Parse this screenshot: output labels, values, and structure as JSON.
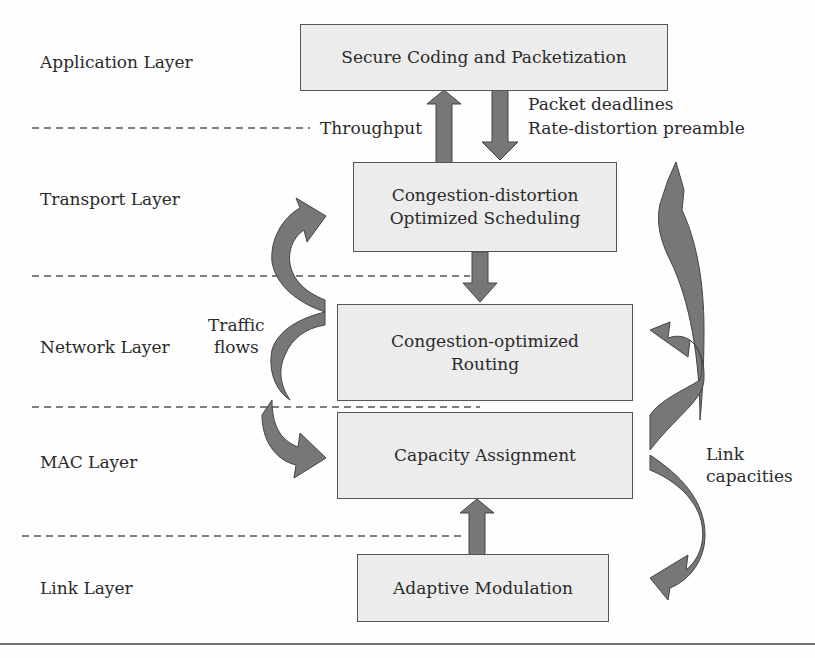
{
  "layers": [
    {
      "label": "Application Layer"
    },
    {
      "label": "Transport Layer"
    },
    {
      "label": "Network Layer"
    },
    {
      "label": "MAC Layer"
    },
    {
      "label": "Link Layer"
    }
  ],
  "boxes": {
    "application": {
      "line1": "Secure Coding and Packetization"
    },
    "transport": {
      "line1": "Congestion-distortion",
      "line2": "Optimized Scheduling"
    },
    "network": {
      "line1": "Congestion-optimized",
      "line2": "Routing"
    },
    "mac": {
      "line1": "Capacity Assignment"
    },
    "link": {
      "line1": "Adaptive Modulation"
    }
  },
  "annotations": {
    "throughput": "Throughput",
    "packet_deadlines": "Packet deadlines",
    "rd_preamble": "Rate-distortion preamble",
    "traffic_line1": "Traffic",
    "traffic_line2": "flows",
    "link_cap_line1": "Link",
    "link_cap_line2": "capacities"
  },
  "colors": {
    "arrow_fill": "#777777",
    "box_fill": "#ececec",
    "box_border": "#555555"
  }
}
